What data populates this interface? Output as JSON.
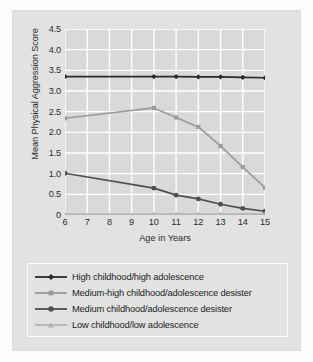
{
  "figure": {
    "panel_bg": "#e2e2e2",
    "plot_bg": "#d9d9d9",
    "gridline_color": "#ffffff"
  },
  "chart_data": {
    "type": "line",
    "title": "",
    "subtitle": "",
    "xlabel": "Age in Years",
    "ylabel": "Mean Physical Aggression Score",
    "xlim": [
      6,
      15
    ],
    "ylim": [
      0,
      4.5
    ],
    "grid": true,
    "legend_position": "below",
    "x_ticks": [
      6,
      7,
      8,
      9,
      10,
      11,
      12,
      13,
      14,
      15
    ],
    "x_tick_labels": [
      "6",
      "7",
      "8",
      "9",
      "10",
      "11",
      "12",
      "13",
      "14",
      "15"
    ],
    "y_ticks": [
      0,
      0.5,
      1.0,
      1.5,
      2.0,
      2.5,
      3.0,
      3.5,
      4.0,
      4.5
    ],
    "y_tick_labels": [
      "0",
      "0.5",
      "1.0",
      "1.5",
      "2.0",
      "2.5",
      "3.0",
      "3.5",
      "4.0",
      "4.5"
    ],
    "x": [
      6,
      10,
      11,
      12,
      13,
      14,
      15
    ],
    "series": [
      {
        "name": "High childhood/high adolescence",
        "marker": "diamond",
        "color": "#2a2a2a",
        "values": [
          3.35,
          3.35,
          3.35,
          3.34,
          3.34,
          3.33,
          3.32
        ]
      },
      {
        "name": "Medium-high childhood/adolescence desister",
        "marker": "square",
        "color": "#9b9b9b",
        "values": [
          2.34,
          2.59,
          2.36,
          2.13,
          1.67,
          1.16,
          0.66
        ]
      },
      {
        "name": "Medium childhood/adolescence desister",
        "marker": "circle",
        "color": "#4f4f4f",
        "values": [
          1.01,
          0.65,
          0.48,
          0.39,
          0.26,
          0.16,
          0.09
        ]
      },
      {
        "name": "Low childhood/low adolescence",
        "marker": "triangle",
        "color": "#b4b4b4",
        "values": [
          0.02,
          0.02,
          0.02,
          0.02,
          0.02,
          0.02,
          0.02
        ]
      }
    ]
  },
  "legend": {
    "items": [
      {
        "label": "High childhood/high adolescence",
        "marker": "diamond",
        "color": "#2a2a2a"
      },
      {
        "label": "Medium-high childhood/adolescence desister",
        "marker": "square",
        "color": "#9b9b9b"
      },
      {
        "label": "Medium childhood/adolescence desister",
        "marker": "circle",
        "color": "#4f4f4f"
      },
      {
        "label": "Low childhood/low adolescence",
        "marker": "triangle",
        "color": "#b4b4b4"
      }
    ]
  }
}
